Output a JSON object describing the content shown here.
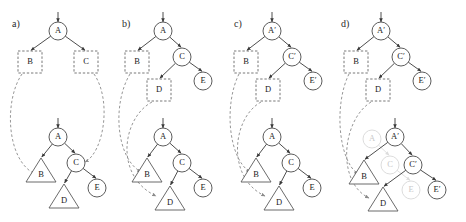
{
  "figure": {
    "background": "#ffffff",
    "ink": "#3a3a3a",
    "faded_ink": "#d8d8d8",
    "dashed_ink": "#8a8a8a"
  },
  "panels": [
    {
      "id": "a",
      "label": "a)",
      "label_x": 12,
      "label_y": 27,
      "upper": {
        "root_arrow": {
          "x": 58,
          "y_from": 12,
          "y_to": 22
        },
        "nodes": [
          {
            "name": "A",
            "text": "A",
            "shape": "circle",
            "x": 58,
            "y": 31,
            "r": 9,
            "faded": false
          },
          {
            "name": "B",
            "text": "B",
            "shape": "box",
            "x": 30,
            "y": 62,
            "w": 24,
            "h": 22,
            "faded": false
          },
          {
            "name": "C",
            "text": "C",
            "shape": "box",
            "x": 86,
            "y": 62,
            "w": 24,
            "h": 22,
            "faded": false
          }
        ],
        "edges": [
          {
            "from": "A",
            "to": "B"
          },
          {
            "from": "A",
            "to": "C"
          }
        ]
      },
      "lower": {
        "root_arrow": {
          "x": 58,
          "y_from": 118,
          "y_to": 128
        },
        "nodes": [
          {
            "name": "A",
            "text": "A",
            "shape": "circle",
            "x": 58,
            "y": 137,
            "r": 9,
            "faded": false
          },
          {
            "name": "B",
            "text": "B",
            "shape": "triangle",
            "x": 41,
            "y": 170,
            "w": 30,
            "h": 24,
            "faded": false
          },
          {
            "name": "C",
            "text": "C",
            "shape": "circle",
            "x": 76,
            "y": 163,
            "r": 9,
            "faded": false
          },
          {
            "name": "D",
            "text": "D",
            "shape": "triangle",
            "x": 64,
            "y": 196,
            "w": 30,
            "h": 24,
            "faded": false
          },
          {
            "name": "E",
            "text": "E",
            "shape": "circle",
            "x": 97,
            "y": 188,
            "r": 9,
            "faded": false
          }
        ],
        "edges": [
          {
            "from": "A",
            "to": "B"
          },
          {
            "from": "A",
            "to": "C"
          },
          {
            "from": "C",
            "to": "D"
          },
          {
            "from": "C",
            "to": "E"
          }
        ]
      },
      "dashed_links": [
        {
          "name": "link-B",
          "d": "M 22 74 C 4 100 6 160 35 174"
        },
        {
          "name": "link-C",
          "d": "M 94 74 C 112 100 104 152 85 162"
        }
      ]
    },
    {
      "id": "b",
      "label": "b)",
      "label_x": 122,
      "label_y": 27,
      "upper": {
        "root_arrow": {
          "x": 163,
          "y_from": 12,
          "y_to": 22
        },
        "nodes": [
          {
            "name": "A",
            "text": "A",
            "shape": "circle",
            "x": 163,
            "y": 31,
            "r": 9,
            "faded": false
          },
          {
            "name": "B",
            "text": "B",
            "shape": "box",
            "x": 137,
            "y": 62,
            "w": 24,
            "h": 22,
            "faded": false
          },
          {
            "name": "C",
            "text": "C",
            "shape": "circle",
            "x": 182,
            "y": 57,
            "r": 9,
            "faded": false
          },
          {
            "name": "D",
            "text": "D",
            "shape": "box",
            "x": 159,
            "y": 90,
            "w": 24,
            "h": 22,
            "faded": false
          },
          {
            "name": "E",
            "text": "E",
            "shape": "circle",
            "x": 203,
            "y": 81,
            "r": 9,
            "faded": false
          }
        ],
        "edges": [
          {
            "from": "A",
            "to": "B"
          },
          {
            "from": "A",
            "to": "C"
          },
          {
            "from": "C",
            "to": "D"
          },
          {
            "from": "C",
            "to": "E"
          }
        ]
      },
      "lower": {
        "root_arrow": {
          "x": 163,
          "y_from": 118,
          "y_to": 128
        },
        "nodes": [
          {
            "name": "A",
            "text": "A",
            "shape": "circle",
            "x": 163,
            "y": 137,
            "r": 9,
            "faded": false
          },
          {
            "name": "B",
            "text": "B",
            "shape": "triangle",
            "x": 147,
            "y": 170,
            "w": 30,
            "h": 24,
            "faded": false
          },
          {
            "name": "C",
            "text": "C",
            "shape": "circle",
            "x": 182,
            "y": 163,
            "r": 9,
            "faded": false
          },
          {
            "name": "D",
            "text": "D",
            "shape": "triangle",
            "x": 170,
            "y": 198,
            "w": 30,
            "h": 24,
            "faded": false
          },
          {
            "name": "E",
            "text": "E",
            "shape": "circle",
            "x": 203,
            "y": 188,
            "r": 9,
            "faded": false
          }
        ],
        "edges": [
          {
            "from": "A",
            "to": "B"
          },
          {
            "from": "A",
            "to": "C"
          },
          {
            "from": "C",
            "to": "D"
          },
          {
            "from": "C",
            "to": "E"
          }
        ]
      },
      "dashed_links": [
        {
          "name": "link-B",
          "d": "M 130 74 C 112 104 116 158 141 172"
        },
        {
          "name": "link-D",
          "d": "M 152 102 C 122 118 114 176 156 196"
        }
      ]
    },
    {
      "id": "c",
      "label": "c)",
      "label_x": 234,
      "label_y": 27,
      "upper": {
        "root_arrow": {
          "x": 272,
          "y_from": 12,
          "y_to": 22
        },
        "nodes": [
          {
            "name": "A-prime",
            "text": "A′",
            "shape": "circle",
            "x": 272,
            "y": 31,
            "r": 9,
            "faded": false
          },
          {
            "name": "B",
            "text": "B",
            "shape": "box",
            "x": 246,
            "y": 62,
            "w": 24,
            "h": 22,
            "faded": false
          },
          {
            "name": "C-prime",
            "text": "C′",
            "shape": "circle",
            "x": 292,
            "y": 57,
            "r": 9,
            "faded": false
          },
          {
            "name": "D",
            "text": "D",
            "shape": "box",
            "x": 268,
            "y": 90,
            "w": 24,
            "h": 22,
            "faded": false
          },
          {
            "name": "E-prime",
            "text": "E′",
            "shape": "circle",
            "x": 313,
            "y": 81,
            "r": 9,
            "faded": false
          }
        ],
        "edges": [
          {
            "from": "A-prime",
            "to": "B"
          },
          {
            "from": "A-prime",
            "to": "C-prime"
          },
          {
            "from": "C-prime",
            "to": "D"
          },
          {
            "from": "C-prime",
            "to": "E-prime"
          }
        ]
      },
      "lower": {
        "root_arrow": {
          "x": 272,
          "y_from": 118,
          "y_to": 128
        },
        "nodes": [
          {
            "name": "A",
            "text": "A",
            "shape": "circle",
            "x": 272,
            "y": 137,
            "r": 9,
            "faded": false
          },
          {
            "name": "B",
            "text": "B",
            "shape": "triangle",
            "x": 256,
            "y": 170,
            "w": 30,
            "h": 24,
            "faded": false
          },
          {
            "name": "C",
            "text": "C",
            "shape": "circle",
            "x": 291,
            "y": 163,
            "r": 9,
            "faded": false
          },
          {
            "name": "D",
            "text": "D",
            "shape": "triangle",
            "x": 279,
            "y": 198,
            "w": 30,
            "h": 24,
            "faded": false
          },
          {
            "name": "E",
            "text": "E",
            "shape": "circle",
            "x": 312,
            "y": 188,
            "r": 9,
            "faded": false
          }
        ],
        "edges": [
          {
            "from": "A",
            "to": "B"
          },
          {
            "from": "A",
            "to": "C"
          },
          {
            "from": "C",
            "to": "D"
          },
          {
            "from": "C",
            "to": "E"
          }
        ]
      },
      "dashed_links": [
        {
          "name": "link-B",
          "d": "M 239 74 C 224 104 228 158 250 172"
        },
        {
          "name": "link-D",
          "d": "M 261 102 C 232 118 226 178 265 196"
        }
      ]
    },
    {
      "id": "d",
      "label": "d)",
      "label_x": 341,
      "label_y": 27,
      "upper": {
        "root_arrow": {
          "x": 381,
          "y_from": 12,
          "y_to": 22
        },
        "nodes": [
          {
            "name": "A-prime",
            "text": "A′",
            "shape": "circle",
            "x": 381,
            "y": 31,
            "r": 9,
            "faded": false
          },
          {
            "name": "B",
            "text": "B",
            "shape": "box",
            "x": 356,
            "y": 62,
            "w": 24,
            "h": 22,
            "faded": false
          },
          {
            "name": "C-prime",
            "text": "C′",
            "shape": "circle",
            "x": 401,
            "y": 57,
            "r": 9,
            "faded": false
          },
          {
            "name": "D",
            "text": "D",
            "shape": "box",
            "x": 378,
            "y": 90,
            "w": 24,
            "h": 22,
            "faded": false
          },
          {
            "name": "E-prime",
            "text": "E′",
            "shape": "circle",
            "x": 422,
            "y": 81,
            "r": 9,
            "faded": false
          }
        ],
        "edges": [
          {
            "from": "A-prime",
            "to": "B"
          },
          {
            "from": "A-prime",
            "to": "C-prime"
          },
          {
            "from": "C-prime",
            "to": "D"
          },
          {
            "from": "C-prime",
            "to": "E-prime"
          }
        ]
      },
      "lower": {
        "root_arrow": {
          "x": 395,
          "y_from": 118,
          "y_to": 128
        },
        "nodes": [
          {
            "name": "A-old",
            "text": "A",
            "shape": "circle",
            "x": 372,
            "y": 139,
            "r": 9,
            "faded": true
          },
          {
            "name": "C-old",
            "text": "C",
            "shape": "circle",
            "x": 390,
            "y": 165,
            "r": 9,
            "faded": true
          },
          {
            "name": "E-old",
            "text": "E",
            "shape": "circle",
            "x": 411,
            "y": 190,
            "r": 9,
            "faded": true
          },
          {
            "name": "A-prime",
            "text": "A′",
            "shape": "circle",
            "x": 395,
            "y": 137,
            "r": 9,
            "faded": false
          },
          {
            "name": "B",
            "text": "B",
            "shape": "triangle",
            "x": 364,
            "y": 172,
            "w": 30,
            "h": 24,
            "faded": false
          },
          {
            "name": "C-prime",
            "text": "C′",
            "shape": "circle",
            "x": 413,
            "y": 165,
            "r": 9,
            "faded": false
          },
          {
            "name": "D",
            "text": "D",
            "shape": "triangle",
            "x": 383,
            "y": 199,
            "w": 30,
            "h": 24,
            "faded": false
          },
          {
            "name": "E-prime",
            "text": "E′",
            "shape": "circle",
            "x": 437,
            "y": 190,
            "r": 9,
            "faded": false
          }
        ],
        "edges": [
          {
            "from": "A-prime",
            "to": "B"
          },
          {
            "from": "A-prime",
            "to": "C-prime"
          },
          {
            "from": "C-prime",
            "to": "D"
          },
          {
            "from": "C-prime",
            "to": "E-prime"
          }
        ],
        "faded_edges": [
          {
            "from": "A-old",
            "to": "C-old"
          },
          {
            "from": "C-old",
            "to": "E-old"
          }
        ]
      },
      "dashed_links": [
        {
          "name": "link-B",
          "d": "M 349 74 C 334 104 338 160 358 174"
        },
        {
          "name": "link-D",
          "d": "M 371 102 C 342 120 336 182 369 198"
        }
      ]
    }
  ]
}
